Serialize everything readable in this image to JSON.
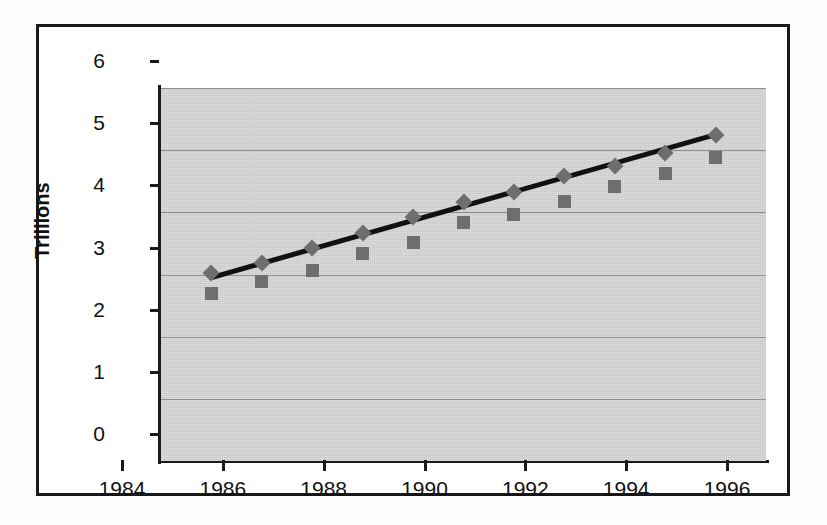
{
  "chart_data": {
    "type": "scatter",
    "title": "",
    "xlabel": "",
    "ylabel": "Trillions",
    "xlim": [
      1984,
      1996
    ],
    "ylim": [
      0,
      6
    ],
    "xticks": [
      1984,
      1986,
      1988,
      1990,
      1992,
      1994,
      1996
    ],
    "yticks": [
      0,
      1,
      2,
      3,
      4,
      5,
      6
    ],
    "xtick_labels": [
      "1984",
      "1986",
      "1988",
      "1990",
      "1992",
      "1994",
      "1996"
    ],
    "ytick_labels": [
      "0",
      "1",
      "2",
      "3",
      "4",
      "5",
      "6"
    ],
    "grid": true,
    "grid_axis": "y",
    "legend": "none",
    "plot_background": "#c9c9c9",
    "marker_color": "#6e6e6e",
    "trendline_color": "#111111",
    "x": [
      1985,
      1986,
      1987,
      1988,
      1989,
      1990,
      1991,
      1992,
      1993,
      1994,
      1995
    ],
    "series": [
      {
        "name": "diamond-series",
        "marker": "diamond",
        "values": [
          3.03,
          3.19,
          3.42,
          3.67,
          3.93,
          4.17,
          4.32,
          4.58,
          4.75,
          4.95,
          5.25
        ]
      },
      {
        "name": "square-series",
        "marker": "square",
        "values": [
          2.7,
          2.89,
          3.06,
          3.33,
          3.52,
          3.83,
          3.97,
          4.18,
          4.41,
          4.63,
          4.88
        ]
      }
    ],
    "trendline": {
      "name": "linear-trend",
      "x_start": 1985,
      "y_start": 2.95,
      "x_end": 1995,
      "y_end": 5.25
    }
  }
}
